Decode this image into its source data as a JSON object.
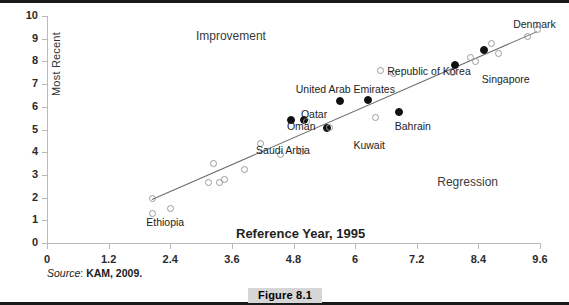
{
  "figure": {
    "caption": "Figure 8.1",
    "source_word": "Source",
    "source_sep": ": ",
    "source_ref": "KAM, 2009."
  },
  "colors": {
    "axis": "#b9b9b9",
    "trend_line": "#6b6b6b",
    "open_marker": "#9a9a9a",
    "filled_marker": "#111111",
    "caption_bg": "#d6d6d6",
    "text": "#1d1d1d"
  },
  "chart_data": {
    "type": "scatter",
    "title": "",
    "xlabel": "Reference Year, 1995",
    "ylabel": "Most Recent",
    "xlim": [
      0,
      9.6
    ],
    "ylim": [
      0,
      10
    ],
    "xticks": [
      0,
      1.2,
      2.4,
      3.6,
      4.8,
      6,
      7.2,
      8.4,
      9.6
    ],
    "xtick_labels": [
      "0",
      "1.2",
      "2.4",
      "3.6",
      "4.8",
      "6",
      "7.2",
      "8.4",
      "9.6"
    ],
    "yticks": [
      0,
      1,
      2,
      3,
      4,
      5,
      6,
      7,
      8,
      9,
      10
    ],
    "ytick_labels": [
      "0",
      "1",
      "2",
      "3",
      "4",
      "5",
      "6",
      "7",
      "8",
      "9",
      "10"
    ],
    "grid": false,
    "legend": false,
    "annotations": [
      {
        "text": "Improvement",
        "x": 2.9,
        "y": 9.1
      },
      {
        "text": "Regression",
        "x": 7.6,
        "y": 2.7
      }
    ],
    "trend_line": {
      "x0": 2.05,
      "y0": 1.95,
      "x1": 9.55,
      "y1": 9.35
    },
    "series": [
      {
        "name": "Highlighted economies",
        "marker": "filled",
        "points": [
          {
            "x": 4.75,
            "y": 5.4,
            "label": "Oman",
            "label_dx": -4,
            "label_dy": 6
          },
          {
            "x": 5.0,
            "y": 5.4,
            "label": "",
            "label_dx": 0,
            "label_dy": 0
          },
          {
            "x": 5.45,
            "y": 5.05,
            "label": "Qatar",
            "label_dx": -26,
            "label_dy": -14
          },
          {
            "x": 5.7,
            "y": 6.25,
            "label": "United Arab Emirates",
            "label_dx": -44,
            "label_dy": -12
          },
          {
            "x": 6.25,
            "y": 6.3,
            "label": "",
            "label_dx": 0,
            "label_dy": 0
          },
          {
            "x": 6.85,
            "y": 5.75,
            "label": "Bahrain",
            "label_dx": -4,
            "label_dy": 14
          },
          {
            "x": 7.95,
            "y": 7.85,
            "label": "Republic of Korea",
            "label_dx": -68,
            "label_dy": 6
          },
          {
            "x": 8.5,
            "y": 8.5,
            "label": "",
            "label_dx": 0,
            "label_dy": 0
          }
        ]
      },
      {
        "name": "Other economies",
        "marker": "open",
        "points": [
          {
            "x": 2.05,
            "y": 1.3,
            "label": "Ethiopia",
            "label_dx": -6,
            "label_dy": 9
          },
          {
            "x": 2.05,
            "y": 1.95,
            "label": "",
            "label_dx": 0,
            "label_dy": 0
          },
          {
            "x": 2.4,
            "y": 1.5,
            "label": "",
            "label_dx": 0,
            "label_dy": 0
          },
          {
            "x": 3.15,
            "y": 2.65,
            "label": "",
            "label_dx": 0,
            "label_dy": 0
          },
          {
            "x": 3.25,
            "y": 3.5,
            "label": "",
            "label_dx": 0,
            "label_dy": 0
          },
          {
            "x": 3.35,
            "y": 2.65,
            "label": "",
            "label_dx": 0,
            "label_dy": 0
          },
          {
            "x": 3.45,
            "y": 2.8,
            "label": "",
            "label_dx": 0,
            "label_dy": 0
          },
          {
            "x": 3.85,
            "y": 3.25,
            "label": "",
            "label_dx": 0,
            "label_dy": 0
          },
          {
            "x": 4.15,
            "y": 4.4,
            "label": "Saudi Arbia",
            "label_dx": -4,
            "label_dy": 7
          },
          {
            "x": 4.55,
            "y": 3.9,
            "label": "",
            "label_dx": 0,
            "label_dy": 0
          },
          {
            "x": 4.95,
            "y": 4.05,
            "label": "",
            "label_dx": 0,
            "label_dy": 0
          },
          {
            "x": 5.05,
            "y": 5.35,
            "label": "",
            "label_dx": 0,
            "label_dy": 0
          },
          {
            "x": 5.5,
            "y": 5.1,
            "label": "Kuwait",
            "label_dx": 24,
            "label_dy": 18
          },
          {
            "x": 6.4,
            "y": 5.55,
            "label": "",
            "label_dx": 0,
            "label_dy": 0
          },
          {
            "x": 6.5,
            "y": 7.6,
            "label": "",
            "label_dx": 0,
            "label_dy": 0
          },
          {
            "x": 6.75,
            "y": 7.45,
            "label": "",
            "label_dx": 0,
            "label_dy": 0
          },
          {
            "x": 7.9,
            "y": 7.5,
            "label": "",
            "label_dx": 0,
            "label_dy": 0
          },
          {
            "x": 8.25,
            "y": 8.15,
            "label": "",
            "label_dx": 0,
            "label_dy": 0
          },
          {
            "x": 8.35,
            "y": 8.0,
            "label": "Singapore",
            "label_dx": 6,
            "label_dy": 18
          },
          {
            "x": 8.65,
            "y": 8.8,
            "label": "",
            "label_dx": 0,
            "label_dy": 0
          },
          {
            "x": 8.8,
            "y": 8.35,
            "label": "",
            "label_dx": 0,
            "label_dy": 0
          },
          {
            "x": 9.35,
            "y": 9.1,
            "label": "Denmark",
            "label_dx": -14,
            "label_dy": -12
          },
          {
            "x": 9.55,
            "y": 9.4,
            "label": "",
            "label_dx": 0,
            "label_dy": 0
          }
        ]
      }
    ]
  }
}
